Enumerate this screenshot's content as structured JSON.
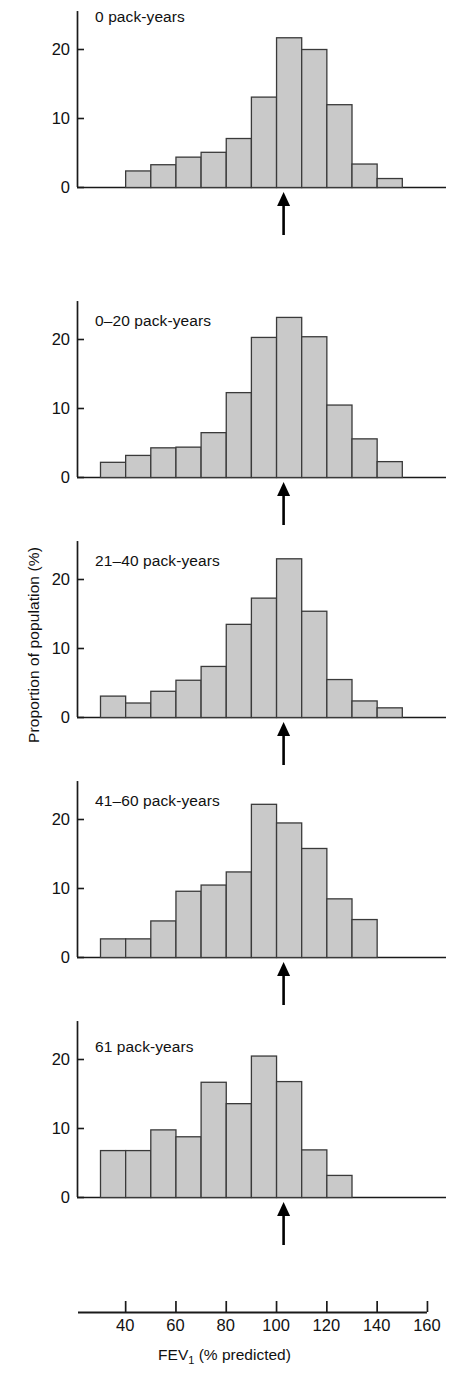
{
  "figure": {
    "y_axis_label": "Proportion of population (%)",
    "x_axis_label_main": "FEV",
    "x_axis_label_sub": "1",
    "x_axis_label_tail": " (% predicted)",
    "x_ticks": [
      40,
      60,
      80,
      100,
      120,
      140,
      160
    ],
    "y_ticks": [
      0,
      10,
      20
    ],
    "bar_fill": "#c9c9c9",
    "bar_stroke": "#3a3a3a",
    "axis_color": "#1a1a1a",
    "arrow_color": "#000000"
  },
  "chart_data": [
    {
      "type": "bar",
      "title": "0 pack-years",
      "xlabel": "FEV1 (% predicted)",
      "ylabel": "Proportion of population (%)",
      "xlim": [
        30,
        160
      ],
      "ylim": [
        0,
        25
      ],
      "bin_width": 10,
      "grid": false,
      "categories": [
        "40-50",
        "50-60",
        "60-70",
        "70-80",
        "80-90",
        "90-100",
        "100-110",
        "110-120",
        "120-130",
        "130-140",
        "140-150"
      ],
      "bin_starts": [
        40,
        50,
        60,
        70,
        80,
        90,
        100,
        110,
        120,
        130,
        140
      ],
      "values": [
        2.4,
        3.3,
        4.4,
        5.1,
        7.1,
        13.1,
        21.7,
        20.0,
        12.0,
        3.4,
        1.3
      ],
      "annotations": [
        {
          "type": "arrow",
          "label": "mean",
          "x": 103,
          "direction": "up"
        }
      ]
    },
    {
      "type": "bar",
      "title": "0–20 pack-years",
      "xlabel": "FEV1 (% predicted)",
      "ylabel": "Proportion of population (%)",
      "xlim": [
        30,
        160
      ],
      "ylim": [
        0,
        25
      ],
      "bin_width": 10,
      "grid": false,
      "categories": [
        "30-40",
        "40-50",
        "50-60",
        "60-70",
        "70-80",
        "80-90",
        "90-100",
        "100-110",
        "110-120",
        "120-130",
        "130-140",
        "140-150"
      ],
      "bin_starts": [
        30,
        40,
        50,
        60,
        70,
        80,
        90,
        100,
        110,
        120,
        130,
        140
      ],
      "values": [
        2.2,
        3.2,
        4.3,
        4.4,
        6.5,
        12.3,
        20.3,
        23.2,
        20.4,
        10.5,
        5.6,
        2.3
      ],
      "annotations": [
        {
          "type": "arrow",
          "label": "mean",
          "x": 103,
          "direction": "up"
        }
      ]
    },
    {
      "type": "bar",
      "title": "21–40 pack-years",
      "xlabel": "FEV1 (% predicted)",
      "ylabel": "Proportion of population (%)",
      "xlim": [
        30,
        160
      ],
      "ylim": [
        0,
        25
      ],
      "bin_width": 10,
      "grid": false,
      "categories": [
        "30-40",
        "40-50",
        "50-60",
        "60-70",
        "70-80",
        "80-90",
        "90-100",
        "100-110",
        "110-120",
        "120-130",
        "130-140",
        "140-150"
      ],
      "bin_starts": [
        30,
        40,
        50,
        60,
        70,
        80,
        90,
        100,
        110,
        120,
        130,
        140
      ],
      "values": [
        3.1,
        2.1,
        3.8,
        5.4,
        7.4,
        13.5,
        17.3,
        23.0,
        15.4,
        5.5,
        2.4,
        1.4
      ],
      "annotations": [
        {
          "type": "arrow",
          "label": "mean",
          "x": 103,
          "direction": "up"
        }
      ]
    },
    {
      "type": "bar",
      "title": "41–60 pack-years",
      "xlabel": "FEV1 (% predicted)",
      "ylabel": "Proportion of population (%)",
      "xlim": [
        30,
        160
      ],
      "ylim": [
        0,
        25
      ],
      "bin_width": 10,
      "grid": false,
      "categories": [
        "30-40",
        "40-50",
        "50-60",
        "60-70",
        "70-80",
        "80-90",
        "90-100",
        "100-110",
        "110-120",
        "120-130",
        "130-140"
      ],
      "bin_starts": [
        30,
        40,
        50,
        60,
        70,
        80,
        90,
        100,
        110,
        120,
        130
      ],
      "values": [
        2.7,
        2.7,
        5.3,
        9.6,
        10.5,
        12.4,
        22.2,
        19.5,
        15.8,
        8.5,
        5.5
      ],
      "annotations": [
        {
          "type": "arrow",
          "label": "mean",
          "x": 103,
          "direction": "up"
        }
      ]
    },
    {
      "type": "bar",
      "title": "61 pack-years",
      "xlabel": "FEV1 (% predicted)",
      "ylabel": "Proportion of population (%)",
      "xlim": [
        30,
        160
      ],
      "ylim": [
        0,
        25
      ],
      "bin_width": 10,
      "grid": false,
      "categories": [
        "30-40",
        "40-50",
        "50-60",
        "60-70",
        "70-80",
        "80-90",
        "90-100",
        "100-110",
        "110-120",
        "120-130"
      ],
      "bin_starts": [
        30,
        40,
        50,
        60,
        70,
        80,
        90,
        100,
        110,
        120
      ],
      "values": [
        6.8,
        6.8,
        9.8,
        8.8,
        16.7,
        13.6,
        20.5,
        16.8,
        6.9,
        3.2
      ],
      "annotations": [
        {
          "type": "arrow",
          "label": "mean",
          "x": 103,
          "direction": "up"
        }
      ]
    }
  ]
}
